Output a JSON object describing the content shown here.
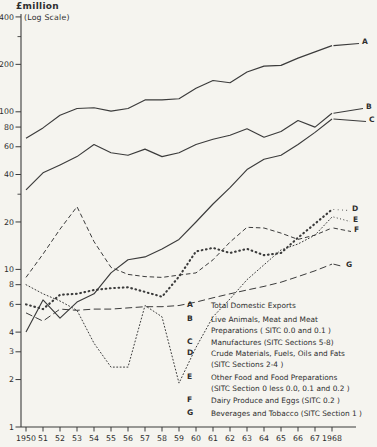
{
  "header": {
    "title": "£million",
    "subtitle": "(Log Scale)"
  },
  "colors": {
    "ink": "#3b3b3b",
    "paper": "#f5f4ef"
  },
  "chart_data": {
    "type": "line",
    "title": "£million",
    "subtitle": "(Log Scale)",
    "x_label": "",
    "y_label": "£million (log scale)",
    "x": [
      1950,
      1951,
      1952,
      1953,
      1954,
      1955,
      1956,
      1957,
      1958,
      1959,
      1960,
      1961,
      1962,
      1963,
      1964,
      1965,
      1966,
      1967,
      1968
    ],
    "x_tick_labels": [
      "1950",
      "51",
      "52",
      "53",
      "54",
      "55",
      "56",
      "57",
      "58",
      "59",
      "60",
      "61",
      "62",
      "63",
      "64",
      "65",
      "66",
      "67",
      "1968"
    ],
    "y_scale": "log",
    "ylim": [
      1,
      450
    ],
    "y_ticks": [
      400,
      200,
      100,
      80,
      60,
      40,
      20,
      10,
      8,
      6,
      4,
      3,
      2,
      1
    ],
    "y_minor_ticks": [
      300,
      30
    ],
    "grid": false,
    "legend_position": "lower-right-inside",
    "series": [
      {
        "letter": "A",
        "name": "Total Domestic Exports",
        "style": "solid",
        "values": [
          68,
          79,
          95,
          105,
          106,
          101,
          105,
          119,
          119,
          121,
          141,
          158,
          153,
          179,
          195,
          197,
          219,
          240,
          263
        ],
        "label_pos": {
          "x": 362,
          "y": 41
        }
      },
      {
        "letter": "B",
        "name": "Live Animals, Meat and Meat Preparations (SITC 0.0 and 0.1)",
        "style": "solid",
        "values": [
          32,
          41,
          46,
          52,
          62,
          55,
          53,
          58,
          52,
          55,
          62,
          67,
          71,
          78,
          69,
          75,
          88,
          80,
          98
        ],
        "label_pos": {
          "x": 366,
          "y": 106
        }
      },
      {
        "letter": "C",
        "name": "Manufactures (SITC Sections 5-8)",
        "style": "solid",
        "values": [
          4.0,
          6.4,
          4.9,
          6.2,
          7.0,
          9.5,
          11.5,
          12,
          13.5,
          15.5,
          20,
          26,
          33,
          43,
          50,
          53,
          62,
          74,
          90
        ],
        "label_pos": {
          "x": 369,
          "y": 119
        }
      },
      {
        "letter": "D",
        "name": "Crude Materials, Fuels, Oils and Fats (SITC Sections 2-4)",
        "style": "dot-bold",
        "values": [
          6.0,
          5.6,
          6.9,
          7.0,
          7.4,
          7.6,
          7.7,
          7.2,
          6.7,
          9.0,
          13.0,
          13.7,
          12.7,
          13.5,
          12.3,
          12.7,
          15.9,
          19.5,
          24
        ],
        "label_pos": {
          "x": 352,
          "y": 208
        }
      },
      {
        "letter": "E",
        "name": "Other Food and Food Preparations (SITC Section 0 less 0.0, 0.1 and 0.2)",
        "style": "dot-fine",
        "values": [
          8.0,
          7.0,
          6.3,
          5.5,
          3.4,
          2.4,
          2.4,
          5.9,
          5.0,
          1.9,
          3.2,
          5.0,
          6.5,
          8.6,
          10.7,
          13.3,
          14.5,
          16.5,
          21.5
        ],
        "label_pos": {
          "x": 353,
          "y": 219
        }
      },
      {
        "letter": "F",
        "name": "Dairy Produce and Eggs (SITC 0.2)",
        "style": "dash",
        "values": [
          8.9,
          12.5,
          18,
          25,
          15,
          10.3,
          9.3,
          9.0,
          8.9,
          9.2,
          9.5,
          11.5,
          14.9,
          18.5,
          18.3,
          17.0,
          15.5,
          16.5,
          18.3
        ],
        "label_pos": {
          "x": 354,
          "y": 229
        }
      },
      {
        "letter": "G",
        "name": "Beverages and Tobacco (SITC Section 1)",
        "style": "dash-long",
        "values": [
          5.3,
          4.7,
          5.6,
          5.5,
          5.6,
          5.6,
          5.7,
          5.8,
          5.8,
          5.9,
          6.2,
          6.6,
          7.0,
          7.4,
          7.8,
          8.3,
          9.0,
          9.8,
          10.8
        ],
        "label_pos": {
          "x": 346,
          "y": 264
        }
      }
    ],
    "legend": [
      {
        "letter": "A",
        "top": 300,
        "lines": [
          "Total Domestic Exports"
        ]
      },
      {
        "letter": "B",
        "top": 314,
        "lines": [
          "Live Animals, Meat and Meat",
          "Preparations ( SITC 0.0 and 0.1 )"
        ]
      },
      {
        "letter": "C",
        "top": 337,
        "lines": [
          "Manufactures  (SITC Sections 5-8)"
        ]
      },
      {
        "letter": "D",
        "top": 348,
        "lines": [
          "Crude Materials, Fuels, Oils and Fats",
          "(SITC  Sections  2-4 )"
        ]
      },
      {
        "letter": "E",
        "top": 372,
        "lines": [
          "Other Food and Food Preparations",
          "(SITC  Section 0  less 0.0,  0.1 and 0.2 )"
        ]
      },
      {
        "letter": "F",
        "top": 395,
        "lines": [
          "Dairy Produce and Eggs   (SITC  0.2 )"
        ]
      },
      {
        "letter": "G",
        "top": 408,
        "lines": [
          "Beverages and Tobacco   (SITC Section 1 )"
        ]
      }
    ]
  }
}
